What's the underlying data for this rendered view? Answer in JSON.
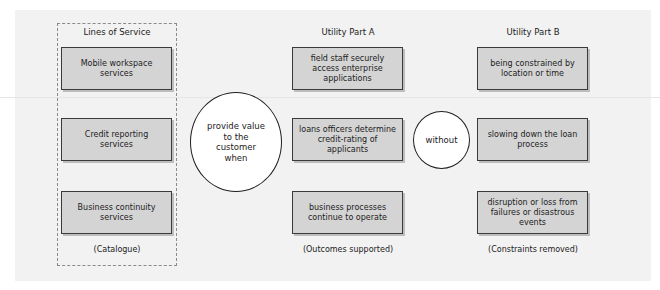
{
  "columns": {
    "lines_of_service": {
      "title": "Lines of Service",
      "items": [
        "Mobile workspace services",
        "Credit reporting services",
        "Business continuity services"
      ],
      "caption": "(Catalogue)"
    },
    "utility_a": {
      "title": "Utility Part A",
      "items": [
        "field staff securely access enterprise applications",
        "loans officers determine credit-rating of applicants",
        "business processes continue to operate"
      ],
      "caption": "(Outcomes supported)"
    },
    "utility_b": {
      "title": "Utility Part B",
      "items": [
        "being constrained by location or time",
        "slowing down the loan process",
        "disruption or loss from failures or disastrous events"
      ],
      "caption": "(Constraints removed)"
    }
  },
  "connectors": {
    "value_circle": "provide value to the customer when",
    "without_circle": "without"
  },
  "colors": {
    "box_fill": "#d4d4d4",
    "box_border": "#3a3a3a",
    "panel_bg": "#f2f2f2"
  }
}
